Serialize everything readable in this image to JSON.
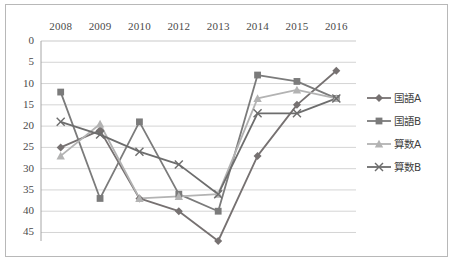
{
  "chart_data": {
    "type": "line",
    "title": "",
    "subtitle": "",
    "xlabel": "",
    "ylabel": "",
    "categories": [
      "2008",
      "2009",
      "2010",
      "2012",
      "2013",
      "2014",
      "2015",
      "2016"
    ],
    "ylim": [
      0,
      47
    ],
    "y_ticks": [
      0,
      5,
      10,
      15,
      20,
      25,
      30,
      35,
      40,
      45
    ],
    "y_axis_inverted": true,
    "grid": true,
    "legend_position": "right",
    "series": [
      {
        "name": "国語A",
        "marker": "diamond",
        "color": "#767171",
        "values": [
          25,
          21,
          37,
          40,
          47,
          27,
          15,
          7
        ]
      },
      {
        "name": "国語B",
        "marker": "square",
        "color": "#7b7b7b",
        "values": [
          12,
          37,
          19,
          36,
          40,
          8,
          9.5,
          13.5
        ]
      },
      {
        "name": "算数A",
        "marker": "triangle",
        "color": "#b3b3b3",
        "values": [
          27,
          19.5,
          37,
          36.5,
          36,
          13.5,
          11.5,
          13.5
        ]
      },
      {
        "name": "算数B",
        "marker": "cross",
        "color": "#6d6d6d",
        "values": [
          19,
          22,
          26,
          29,
          36,
          17,
          17,
          13.5
        ]
      }
    ]
  },
  "legend": {
    "items": [
      {
        "label": "国語A",
        "icon": "diamond-marker-icon"
      },
      {
        "label": "国語B",
        "icon": "square-marker-icon"
      },
      {
        "label": "算数A",
        "icon": "triangle-marker-icon"
      },
      {
        "label": "算数B",
        "icon": "cross-marker-icon"
      }
    ]
  },
  "colors": {
    "grid": "#c9c9c9",
    "axis": "#a6a6a6",
    "border": "#b8b8b8",
    "background": "#ffffff",
    "text": "#4a4a4a"
  }
}
